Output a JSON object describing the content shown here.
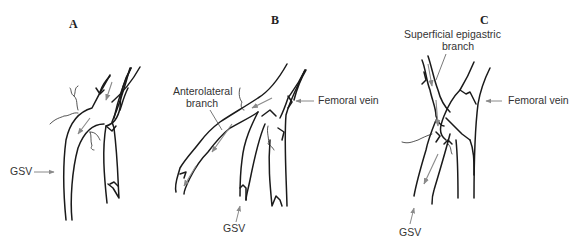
{
  "figure": {
    "panels": [
      {
        "id": "A",
        "letter": "A",
        "labels": {
          "gsv": "GSV"
        }
      },
      {
        "id": "B",
        "letter": "B",
        "labels": {
          "branch_line1": "Anterolateral",
          "branch_line2": "branch",
          "femoral": "Femoral vein",
          "gsv": "GSV"
        }
      },
      {
        "id": "C",
        "letter": "C",
        "labels": {
          "branch_line1": "Superficial epigastric",
          "branch_line2": "branch",
          "femoral": "Femoral vein",
          "gsv": "GSV"
        }
      }
    ],
    "colors": {
      "vein_stroke": "#1a1a1a",
      "arrow_gray": "#8a8a8a",
      "background": "#ffffff"
    }
  }
}
